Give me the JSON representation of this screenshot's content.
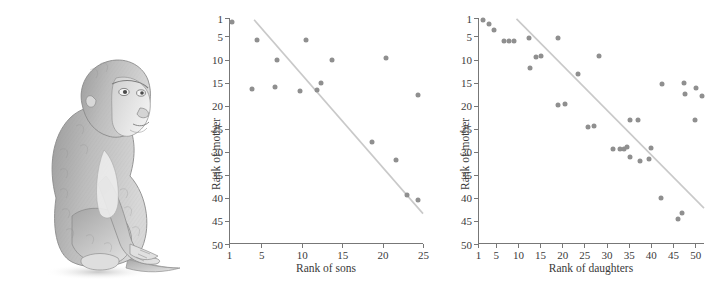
{
  "figure": {
    "illustration": {
      "name": "macaque-pencil-sketch",
      "alt": "Pencil sketch of a seated macaque monkey"
    }
  },
  "chart_data": [
    {
      "type": "scatter",
      "id": "sons",
      "title": "",
      "xlabel": "Rank of sons",
      "ylabel": "Rank of mother",
      "xlim": [
        1,
        25
      ],
      "ylim": [
        1,
        50
      ],
      "y_inverted": true,
      "grid": false,
      "legend": null,
      "xticks": [
        1,
        5,
        10,
        15,
        20,
        25
      ],
      "yticks": [
        1,
        5,
        10,
        15,
        20,
        25,
        30,
        35,
        40,
        45,
        50
      ],
      "xtick_labels": [
        "1",
        "5",
        "10",
        "15",
        "20",
        "25"
      ],
      "ytick_labels": [
        "1",
        "5",
        "10",
        "15",
        "20",
        "25",
        "30",
        "35",
        "40",
        "45",
        "50"
      ],
      "point_color": "#8f8f8f",
      "line_color": "#c9c9c9",
      "points": [
        {
          "x": 1.3,
          "y": 1.8
        },
        {
          "x": 4.4,
          "y": 5.8
        },
        {
          "x": 6.8,
          "y": 10.0
        },
        {
          "x": 10.4,
          "y": 5.8
        },
        {
          "x": 13.6,
          "y": 10.1
        },
        {
          "x": 20.3,
          "y": 9.7
        },
        {
          "x": 3.7,
          "y": 16.4
        },
        {
          "x": 6.6,
          "y": 16.0
        },
        {
          "x": 9.6,
          "y": 16.9
        },
        {
          "x": 11.8,
          "y": 16.7
        },
        {
          "x": 12.2,
          "y": 15.1
        },
        {
          "x": 24.2,
          "y": 17.8
        },
        {
          "x": 18.6,
          "y": 27.8
        },
        {
          "x": 21.5,
          "y": 31.8
        },
        {
          "x": 22.9,
          "y": 39.4
        },
        {
          "x": 24.2,
          "y": 40.5
        }
      ],
      "fit_line": {
        "x0": 4.0,
        "y0": 1.4,
        "x1": 25.0,
        "y1": 43.6
      }
    },
    {
      "type": "scatter",
      "id": "daughters",
      "title": "",
      "xlabel": "Rank of daughters",
      "ylabel": "Rank of mother",
      "xlim": [
        1,
        52
      ],
      "ylim": [
        1,
        50
      ],
      "y_inverted": true,
      "grid": false,
      "legend": null,
      "xticks": [
        1,
        5,
        10,
        15,
        20,
        25,
        30,
        35,
        40,
        45,
        50
      ],
      "yticks": [
        1,
        5,
        10,
        15,
        20,
        25,
        30,
        35,
        40,
        45,
        50
      ],
      "xtick_labels": [
        "1",
        "5",
        "10",
        "15",
        "20",
        "25",
        "30",
        "35",
        "40",
        "45",
        "50"
      ],
      "ytick_labels": [
        "1",
        "5",
        "10",
        "15",
        "20",
        "25",
        "30",
        "35",
        "40",
        "45",
        "50"
      ],
      "point_color": "#8f8f8f",
      "line_color": "#c9c9c9",
      "points": [
        {
          "x": 2.0,
          "y": 1.5
        },
        {
          "x": 3.2,
          "y": 2.2
        },
        {
          "x": 4.3,
          "y": 3.5
        },
        {
          "x": 6.6,
          "y": 6.0
        },
        {
          "x": 7.8,
          "y": 6.0
        },
        {
          "x": 9.0,
          "y": 6.0
        },
        {
          "x": 12.2,
          "y": 5.4
        },
        {
          "x": 18.8,
          "y": 5.4
        },
        {
          "x": 13.8,
          "y": 9.4
        },
        {
          "x": 15.0,
          "y": 9.3
        },
        {
          "x": 28.0,
          "y": 9.2
        },
        {
          "x": 12.5,
          "y": 11.8
        },
        {
          "x": 23.3,
          "y": 13.2
        },
        {
          "x": 42.2,
          "y": 15.4
        },
        {
          "x": 47.3,
          "y": 15.0
        },
        {
          "x": 49.9,
          "y": 16.1
        },
        {
          "x": 47.5,
          "y": 17.5
        },
        {
          "x": 51.3,
          "y": 18.0
        },
        {
          "x": 18.8,
          "y": 19.9
        },
        {
          "x": 20.3,
          "y": 19.6
        },
        {
          "x": 25.5,
          "y": 24.7
        },
        {
          "x": 27.0,
          "y": 24.4
        },
        {
          "x": 35.0,
          "y": 23.2
        },
        {
          "x": 36.8,
          "y": 23.2
        },
        {
          "x": 49.7,
          "y": 23.2
        },
        {
          "x": 31.3,
          "y": 29.5
        },
        {
          "x": 32.8,
          "y": 29.4
        },
        {
          "x": 33.8,
          "y": 29.3
        },
        {
          "x": 34.3,
          "y": 28.9
        },
        {
          "x": 39.8,
          "y": 29.2
        },
        {
          "x": 35.0,
          "y": 31.2
        },
        {
          "x": 37.3,
          "y": 32.0
        },
        {
          "x": 39.3,
          "y": 31.5
        },
        {
          "x": 42.1,
          "y": 40.1
        },
        {
          "x": 46.9,
          "y": 43.3
        },
        {
          "x": 46.0,
          "y": 44.5
        }
      ],
      "fit_line": {
        "x0": 9.5,
        "y0": 1.2,
        "x1": 52.0,
        "y1": 42.4
      }
    }
  ]
}
